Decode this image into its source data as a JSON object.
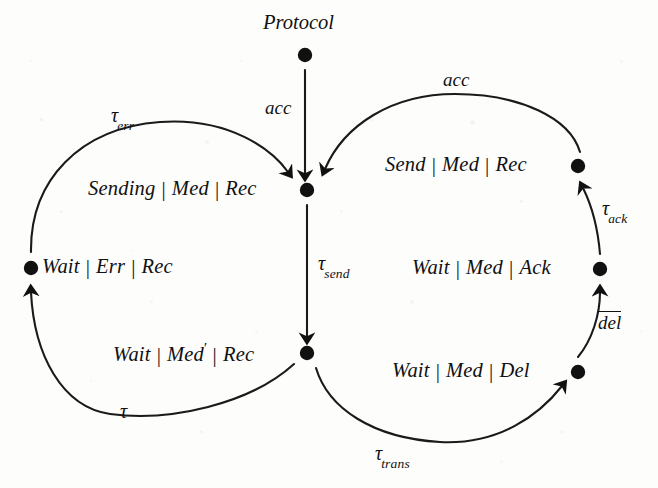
{
  "figure": {
    "background_color": "#fdfdfc",
    "ink_color": "#111111"
  },
  "nodes": [
    {
      "id": "protocol",
      "name": "protocol-node",
      "title": "Protocol",
      "dot": {
        "x": 305,
        "y": 55
      },
      "title_pos": {
        "x": 263,
        "y": 12
      }
    },
    {
      "id": "sending-med-rec",
      "name": "state-sending-med-rec",
      "parts": [
        "Sending",
        "Med",
        "Rec"
      ],
      "primed": [],
      "dot": {
        "x": 307,
        "y": 190
      },
      "label_pos": {
        "x": 88,
        "y": 178
      },
      "dot_side": "right"
    },
    {
      "id": "send-med-rec",
      "name": "state-send-med-rec",
      "parts": [
        "Send",
        "Med",
        "Rec"
      ],
      "primed": [],
      "dot": {
        "x": 578,
        "y": 166
      },
      "label_pos": {
        "x": 385,
        "y": 154
      },
      "dot_side": "right"
    },
    {
      "id": "wait-err-rec",
      "name": "state-wait-err-rec",
      "parts": [
        "Wait",
        "Err",
        "Rec"
      ],
      "primed": [],
      "dot": {
        "x": 31,
        "y": 268
      },
      "label_pos": {
        "x": 42,
        "y": 256
      },
      "dot_side": "left"
    },
    {
      "id": "wait-med-ack",
      "name": "state-wait-med-ack",
      "parts": [
        "Wait",
        "Med",
        "Ack"
      ],
      "primed": [],
      "dot": {
        "x": 600,
        "y": 269
      },
      "label_pos": {
        "x": 412,
        "y": 257
      },
      "dot_side": "right"
    },
    {
      "id": "wait-medprime-rec",
      "name": "state-wait-medprime-rec",
      "parts": [
        "Wait",
        "Med",
        "Rec"
      ],
      "primed": [
        "Med"
      ],
      "dot": {
        "x": 307,
        "y": 353
      },
      "label_pos": {
        "x": 113,
        "y": 341
      },
      "dot_side": "right"
    },
    {
      "id": "wait-med-del",
      "name": "state-wait-med-del",
      "parts": [
        "Wait",
        "Med",
        "Del"
      ],
      "primed": [],
      "dot": {
        "x": 578,
        "y": 372
      },
      "label_pos": {
        "x": 392,
        "y": 360
      },
      "dot_side": "right"
    }
  ],
  "edges": [
    {
      "id": "protocol-to-sending",
      "name": "edge-acc-protocol",
      "from": "protocol",
      "to": "sending-med-rec",
      "label": "acc",
      "label_kind": "plain",
      "label_pos": {
        "x": 265,
        "y": 98
      },
      "path": "M 305 70 L 305 174",
      "arrow": {
        "x": 305,
        "y": 182,
        "angle": 90
      }
    },
    {
      "id": "sending-to-waitmedprime",
      "name": "edge-tau-send",
      "from": "sending-med-rec",
      "to": "wait-medprime-rec",
      "label": "tau",
      "label_sub": "send",
      "label_kind": "tau",
      "label_pos": {
        "x": 318,
        "y": 253
      },
      "path": "M 307 205 L 307 337",
      "arrow": {
        "x": 307,
        "y": 345,
        "angle": 90
      }
    },
    {
      "id": "waiterr-to-sending",
      "name": "edge-tau-err",
      "from": "wait-err-rec",
      "to": "sending-med-rec",
      "label": "tau",
      "label_sub": "err",
      "label_kind": "tau",
      "label_pos": {
        "x": 111,
        "y": 105
      },
      "path": "M 31 252 C 30 180, 80 128, 160 122 C 230 117, 272 150, 288 172",
      "arrow": {
        "x": 295,
        "y": 181,
        "angle": 52
      }
    },
    {
      "id": "waitmedprime-to-waiterr",
      "name": "edge-tau",
      "from": "wait-medprime-rec",
      "to": "wait-err-rec",
      "label": "tau",
      "label_sub": "",
      "label_kind": "tau",
      "label_pos": {
        "x": 120,
        "y": 401
      },
      "path": "M 294 364 C 250 404, 170 422, 110 414 C 62 407, 34 355, 31 292",
      "arrow": {
        "x": 31,
        "y": 284,
        "angle": 270
      }
    },
    {
      "id": "sendmedrec-to-sending",
      "name": "edge-acc-send",
      "from": "send-med-rec",
      "to": "sending-med-rec",
      "label": "acc",
      "label_kind": "plain",
      "label_pos": {
        "x": 443,
        "y": 70
      },
      "path": "M 580 152 C 570 118, 520 94, 455 94 C 392 94, 344 125, 325 169",
      "arrow": {
        "x": 320,
        "y": 180,
        "angle": 114
      }
    },
    {
      "id": "waitmedack-to-sendmedrec",
      "name": "edge-tau-ack",
      "from": "wait-med-ack",
      "to": "send-med-rec",
      "label": "tau",
      "label_sub": "ack",
      "label_kind": "tau",
      "label_pos": {
        "x": 602,
        "y": 198
      },
      "path": "M 600 254 C 598 230, 592 206, 583 188",
      "arrow": {
        "x": 579,
        "y": 180,
        "angle": 248
      }
    },
    {
      "id": "waitmeddel-to-waitmedack",
      "name": "edge-del-complement",
      "from": "wait-med-del",
      "to": "wait-med-ack",
      "label": "del",
      "label_kind": "overline",
      "label_pos": {
        "x": 598,
        "y": 311
      },
      "path": "M 578 357 C 592 340, 600 315, 600 292",
      "arrow": {
        "x": 600,
        "y": 284,
        "angle": 270
      }
    },
    {
      "id": "waitmedprime-to-waitmeddel",
      "name": "edge-tau-trans",
      "from": "wait-medprime-rec",
      "to": "wait-med-del",
      "label": "tau",
      "label_sub": "trans",
      "label_kind": "tau",
      "label_pos": {
        "x": 375,
        "y": 443
      },
      "path": "M 316 368 C 328 408, 372 438, 440 442 C 500 445, 540 414, 562 386",
      "arrow": {
        "x": 568,
        "y": 379,
        "angle": 310
      }
    }
  ]
}
